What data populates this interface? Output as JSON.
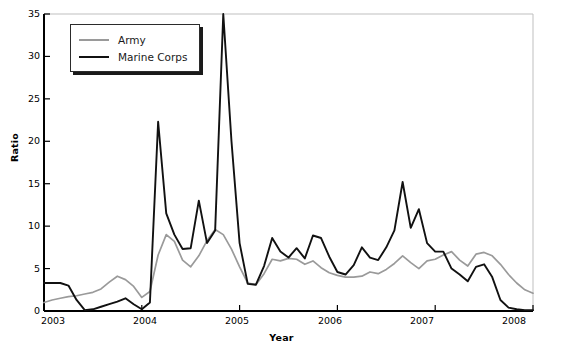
{
  "chart_data": {
    "type": "line",
    "title": "",
    "xlabel": "Year",
    "ylabel": "Ratio",
    "xlim": [
      2003,
      2008
    ],
    "ylim": [
      0,
      35
    ],
    "ytick_labels": [
      "0",
      "5",
      "10",
      "15",
      "20",
      "25",
      "30",
      "35"
    ],
    "yticks": [
      0,
      5,
      10,
      15,
      20,
      25,
      30,
      35
    ],
    "xtick_labels": [
      "2003",
      "2004",
      "2005",
      "2006",
      "2007",
      "2008"
    ],
    "xticks": [
      2003,
      2004,
      2005,
      2006,
      2007,
      2008
    ],
    "grid": false,
    "legend_position": "top-left",
    "series": [
      {
        "name": "Army",
        "color": "#9a9a9a",
        "x": [
          2003.0,
          2003.083,
          2003.167,
          2003.25,
          2003.333,
          2003.417,
          2003.5,
          2003.583,
          2003.667,
          2003.75,
          2003.833,
          2003.917,
          2004.0,
          2004.083,
          2004.167,
          2004.25,
          2004.333,
          2004.417,
          2004.5,
          2004.583,
          2004.667,
          2004.75,
          2004.833,
          2004.917,
          2005.0,
          2005.083,
          2005.167,
          2005.25,
          2005.333,
          2005.417,
          2005.5,
          2005.583,
          2005.667,
          2005.75,
          2005.833,
          2005.917,
          2006.0,
          2006.083,
          2006.167,
          2006.25,
          2006.333,
          2006.417,
          2006.5,
          2006.583,
          2006.667,
          2006.75,
          2006.833,
          2006.917,
          2007.0,
          2007.083,
          2007.167,
          2007.25,
          2007.333,
          2007.417,
          2007.5,
          2007.583,
          2007.667,
          2007.75,
          2007.833,
          2007.917,
          2008.0
        ],
        "values": [
          1.0,
          1.3,
          1.5,
          1.7,
          1.8,
          2.0,
          2.2,
          2.6,
          3.4,
          4.1,
          3.7,
          2.9,
          1.6,
          2.3,
          6.6,
          9.0,
          8.2,
          6.0,
          5.2,
          6.5,
          8.3,
          9.6,
          9.0,
          7.3,
          5.2,
          3.3,
          3.1,
          4.4,
          6.1,
          5.9,
          6.2,
          6.1,
          5.5,
          5.9,
          5.1,
          4.5,
          4.2,
          4.0,
          4.0,
          4.1,
          4.6,
          4.4,
          4.9,
          5.6,
          6.5,
          5.7,
          5.0,
          5.9,
          6.1,
          6.6,
          7.0,
          6.0,
          5.3,
          6.7,
          6.9,
          6.5,
          5.5,
          4.3,
          3.3,
          2.5,
          2.1
        ]
      },
      {
        "name": "Marine Corps",
        "color": "#111111",
        "x": [
          2003.0,
          2003.083,
          2003.167,
          2003.25,
          2003.333,
          2003.417,
          2003.5,
          2003.583,
          2003.667,
          2003.75,
          2003.833,
          2003.917,
          2004.0,
          2004.083,
          2004.167,
          2004.25,
          2004.333,
          2004.417,
          2004.5,
          2004.583,
          2004.667,
          2004.75,
          2004.833,
          2004.917,
          2005.0,
          2005.083,
          2005.167,
          2005.25,
          2005.333,
          2005.417,
          2005.5,
          2005.583,
          2005.667,
          2005.75,
          2005.833,
          2005.917,
          2006.0,
          2006.083,
          2006.167,
          2006.25,
          2006.333,
          2006.417,
          2006.5,
          2006.583,
          2006.667,
          2006.75,
          2006.833,
          2006.917,
          2007.0,
          2007.083,
          2007.167,
          2007.25,
          2007.333,
          2007.417,
          2007.5,
          2007.583,
          2007.667,
          2007.75,
          2007.833,
          2007.917,
          2008.0
        ],
        "values": [
          3.3,
          3.3,
          3.3,
          3.0,
          1.3,
          0.1,
          0.2,
          0.5,
          0.8,
          1.1,
          1.5,
          0.8,
          0.2,
          1.0,
          22.3,
          11.5,
          9.0,
          7.3,
          7.4,
          13.0,
          8.0,
          9.5,
          35.0,
          20.0,
          8.0,
          3.2,
          3.1,
          5.3,
          8.6,
          7.0,
          6.3,
          7.4,
          6.2,
          8.9,
          8.6,
          6.4,
          4.6,
          4.3,
          5.4,
          7.5,
          6.3,
          6.0,
          7.5,
          9.5,
          15.2,
          9.8,
          12.0,
          8.0,
          7.0,
          7.0,
          5.0,
          4.3,
          3.5,
          5.2,
          5.5,
          4.0,
          1.3,
          0.4,
          0.2,
          0.1,
          0.1
        ]
      }
    ]
  },
  "axes": {
    "ylabel": "Ratio",
    "xlabel": "Year",
    "ytick_labels": [
      "35",
      "30",
      "25",
      "20",
      "15",
      "10",
      "5",
      "0"
    ],
    "xtick_labels": [
      "2003",
      "2004",
      "2005",
      "2006",
      "2007",
      "2008"
    ]
  },
  "legend": {
    "items": [
      {
        "label": "Army",
        "color": "#9a9a9a"
      },
      {
        "label": "Marine Corps",
        "color": "#111111"
      }
    ]
  },
  "colors": {
    "army": "#9a9a9a",
    "marine": "#111111",
    "axis": "#000000",
    "frame": "#bfbfbf",
    "background": "#ffffff"
  }
}
